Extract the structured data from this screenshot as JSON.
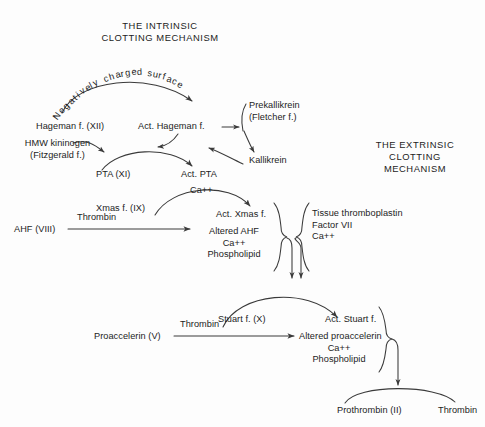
{
  "figure": {
    "background_color": "#fdfdfd",
    "ink_color": "#3a3a3a",
    "text_color": "#1c1c1c"
  },
  "titles": {
    "intrinsic": "THE INTRINSIC\nCLOTTING MECHANISM",
    "extrinsic": "THE EXTRINSIC\nCLOTTING\nMECHANISM"
  },
  "curved_surface_label": {
    "chars": [
      "N",
      "e",
      "g",
      "a",
      "t",
      "i",
      "v",
      "e",
      "l",
      "y",
      " ",
      "c",
      "h",
      "a",
      "r",
      "g",
      "e",
      "d",
      " ",
      "s",
      "u",
      "r",
      "f",
      "a",
      "c",
      "e"
    ],
    "text": "Negatively charged surface"
  },
  "nodes": {
    "hageman": "Hageman f. (XII)",
    "act_hageman": "Act. Hageman f.",
    "hmw_kininogen": "HMW kininogen\n(Fitzgerald f.)",
    "prekallikrein": "Prekallikrein\n(Fletcher f.)",
    "kallikrein": "Kallikrein",
    "pta": "PTA (XI)",
    "act_pta": "Act. PTA",
    "ca_pta": "Ca++",
    "xmas": "Xmas f. (IX)",
    "act_xmas": "Act. Xmas f.",
    "ahf": "AHF (VIII)",
    "thrombin_ahf": "Thrombin",
    "altered_ahf_group": "Altered AHF\nCa++\nPhospholipid",
    "tissue_group": "Tissue thromboplastin\nFactor VII\nCa++",
    "stuart": "Stuart f. (X)",
    "act_stuart": "Act. Stuart f.",
    "proaccelerin": "Proaccelerin (V)",
    "thrombin_proacc": "Thrombin",
    "altered_proacc_group": "Altered proaccelerin\nCa++\nPhospholipid",
    "prothrombin": "Prothrombin (II)",
    "thrombin_final": "Thrombin"
  }
}
